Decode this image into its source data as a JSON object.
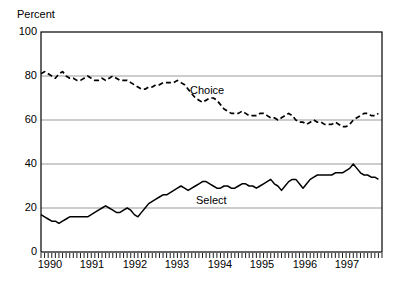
{
  "chart_data": {
    "type": "line",
    "title": "",
    "subtitle": "",
    "xlabel": "",
    "ylabel": "Percent",
    "ylim": [
      0,
      100
    ],
    "xlim": [
      1990.0,
      1997.9167
    ],
    "grid": true,
    "gridlines_y": [
      20,
      40,
      60,
      80
    ],
    "legend_position": "inline-annotation",
    "ytick_labels": [
      "0",
      "20",
      "40",
      "60",
      "80",
      "100"
    ],
    "ytick_values": [
      0,
      20,
      40,
      60,
      80,
      100
    ],
    "xtick_labels": [
      "1990",
      "1991",
      "1992",
      "1993",
      "1994",
      "1995",
      "1996",
      "1997"
    ],
    "xtick_values": [
      1990,
      1991,
      1992,
      1993,
      1994,
      1995,
      1996,
      1997
    ],
    "minor_ticks": "monthly",
    "series": [
      {
        "name": "Choice",
        "style": "dashed",
        "color": "#000000",
        "x": [
          1990.0,
          1990.0833,
          1990.1667,
          1990.25,
          1990.3333,
          1990.4167,
          1990.5,
          1990.5833,
          1990.6667,
          1990.75,
          1990.8333,
          1990.9167,
          1991.0,
          1991.0833,
          1991.1667,
          1991.25,
          1991.3333,
          1991.4167,
          1991.5,
          1991.5833,
          1991.6667,
          1991.75,
          1991.8333,
          1991.9167,
          1992.0,
          1992.0833,
          1992.1667,
          1992.25,
          1992.3333,
          1992.4167,
          1992.5,
          1992.5833,
          1992.6667,
          1992.75,
          1992.8333,
          1992.9167,
          1993.0,
          1993.0833,
          1993.1667,
          1993.25,
          1993.3333,
          1993.4167,
          1993.5,
          1993.5833,
          1993.6667,
          1993.75,
          1993.8333,
          1993.9167,
          1994.0,
          1994.0833,
          1994.1667,
          1994.25,
          1994.3333,
          1994.4167,
          1994.5,
          1994.5833,
          1994.6667,
          1994.75,
          1994.8333,
          1994.9167,
          1995.0,
          1995.0833,
          1995.1667,
          1995.25,
          1995.3333,
          1995.4167,
          1995.5,
          1995.5833,
          1995.6667,
          1995.75,
          1995.8333,
          1995.9167,
          1996.0,
          1996.0833,
          1996.1667,
          1996.25,
          1996.3333,
          1996.4167,
          1996.5,
          1996.5833,
          1996.6667,
          1996.75,
          1996.8333,
          1996.9167,
          1997.0,
          1997.0833,
          1997.1667,
          1997.25,
          1997.3333,
          1997.4167,
          1997.5,
          1997.5833,
          1997.6667,
          1997.75,
          1997.8333
        ],
        "values": [
          81,
          82,
          81,
          80,
          79,
          81,
          82,
          80,
          79,
          79,
          78,
          78,
          79,
          80,
          79,
          78,
          78,
          79,
          78,
          79,
          80,
          79,
          78,
          78,
          78,
          77,
          76,
          75,
          74,
          74,
          75,
          75,
          76,
          76,
          77,
          77,
          77,
          77,
          78,
          77,
          76,
          74,
          72,
          70,
          69,
          68,
          69,
          70,
          70,
          69,
          67,
          65,
          64,
          63,
          63,
          63,
          64,
          63,
          62,
          62,
          62,
          63,
          63,
          62,
          61,
          61,
          60,
          61,
          62,
          63,
          62,
          60,
          59,
          59,
          58,
          59,
          60,
          59,
          59,
          58,
          58,
          58,
          59,
          58,
          57,
          57,
          58,
          60,
          61,
          62,
          63,
          63,
          62,
          62,
          63
        ]
      },
      {
        "name": "Select",
        "style": "solid",
        "color": "#000000",
        "x": [
          1990.0,
          1990.0833,
          1990.1667,
          1990.25,
          1990.3333,
          1990.4167,
          1990.5,
          1990.5833,
          1990.6667,
          1990.75,
          1990.8333,
          1990.9167,
          1991.0,
          1991.0833,
          1991.1667,
          1991.25,
          1991.3333,
          1991.4167,
          1991.5,
          1991.5833,
          1991.6667,
          1991.75,
          1991.8333,
          1991.9167,
          1992.0,
          1992.0833,
          1992.1667,
          1992.25,
          1992.3333,
          1992.4167,
          1992.5,
          1992.5833,
          1992.6667,
          1992.75,
          1992.8333,
          1992.9167,
          1993.0,
          1993.0833,
          1993.1667,
          1993.25,
          1993.3333,
          1993.4167,
          1993.5,
          1993.5833,
          1993.6667,
          1993.75,
          1993.8333,
          1993.9167,
          1994.0,
          1994.0833,
          1994.1667,
          1994.25,
          1994.3333,
          1994.4167,
          1994.5,
          1994.5833,
          1994.6667,
          1994.75,
          1994.8333,
          1994.9167,
          1995.0,
          1995.0833,
          1995.1667,
          1995.25,
          1995.3333,
          1995.4167,
          1995.5,
          1995.5833,
          1995.6667,
          1995.75,
          1995.8333,
          1995.9167,
          1996.0,
          1996.0833,
          1996.1667,
          1996.25,
          1996.3333,
          1996.4167,
          1996.5,
          1996.5833,
          1996.6667,
          1996.75,
          1996.8333,
          1996.9167,
          1997.0,
          1997.0833,
          1997.1667,
          1997.25,
          1997.3333,
          1997.4167,
          1997.5,
          1997.5833,
          1997.6667,
          1997.75,
          1997.8333
        ],
        "values": [
          17,
          16,
          15,
          14,
          14,
          13,
          14,
          15,
          16,
          16,
          16,
          16,
          16,
          16,
          17,
          18,
          19,
          20,
          21,
          20,
          19,
          18,
          18,
          19,
          20,
          19,
          17,
          16,
          18,
          20,
          22,
          23,
          24,
          25,
          26,
          26,
          27,
          28,
          29,
          30,
          29,
          28,
          29,
          30,
          31,
          32,
          32,
          31,
          30,
          29,
          29,
          30,
          30,
          29,
          29,
          30,
          31,
          31,
          30,
          30,
          29,
          30,
          31,
          32,
          33,
          31,
          30,
          28,
          30,
          32,
          33,
          33,
          31,
          29,
          31,
          33,
          34,
          35,
          35,
          35,
          35,
          35,
          36,
          36,
          36,
          37,
          38,
          40,
          38,
          36,
          35,
          35,
          34,
          34,
          33
        ]
      }
    ]
  }
}
